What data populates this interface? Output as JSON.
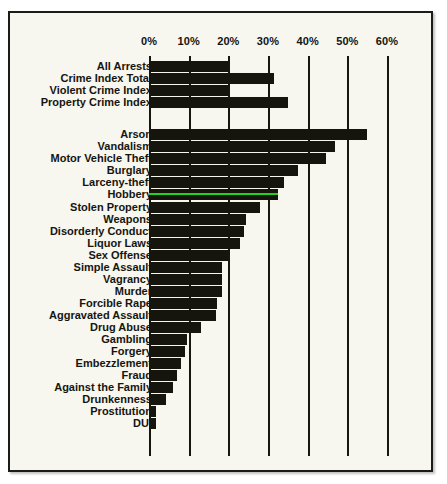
{
  "chart_data": {
    "type": "bar",
    "orientation": "horizontal",
    "title": "",
    "subtitle": "",
    "xlabel": "",
    "ylabel": "",
    "xlim": [
      0,
      60
    ],
    "xtick_labels": [
      "0%",
      "10%",
      "20%",
      "30%",
      "40%",
      "50%",
      "60%"
    ],
    "xticks": [
      0,
      10,
      20,
      30,
      40,
      50,
      60
    ],
    "grid": true,
    "legend": "none",
    "bar_color": "#15150d",
    "highlight_color": "#1fd31f",
    "background_color": "#f7f6ef",
    "groups": [
      {
        "name": "index-totals",
        "categories": [
          "All Arrests",
          "Crime Index Total",
          "Violent Crime Index",
          "Property Crime Index"
        ],
        "values": [
          20,
          31.5,
          20,
          35
        ]
      },
      {
        "name": "offense-types",
        "categories": [
          "Arson",
          "Vandalism",
          "Motor Vehicle Theft",
          "Burglary",
          "Larceny-theft",
          "Hobbery",
          "Stolen Property",
          "Weapons",
          "Disorderly Conduct",
          "Liquor Laws",
          "Sex Offense",
          "Simple Assault",
          "Vagrancy",
          "Murder",
          "Forcible Rape",
          "Aggravated Assault",
          "Drug Abuse",
          "Gambling",
          "Forgery",
          "Embezzlement",
          "Fraud",
          "Against the Family",
          "Drunkenness",
          "Prostitution",
          "DUI"
        ],
        "values": [
          55,
          47,
          44.5,
          37.5,
          34,
          32.5,
          28,
          24.5,
          24,
          23,
          20,
          18.5,
          18.3,
          18.5,
          17.2,
          17,
          13,
          9.5,
          9,
          8,
          7,
          6,
          4.2,
          1.8,
          1.8
        ],
        "highlighted": [
          "Hobbery"
        ]
      }
    ]
  }
}
